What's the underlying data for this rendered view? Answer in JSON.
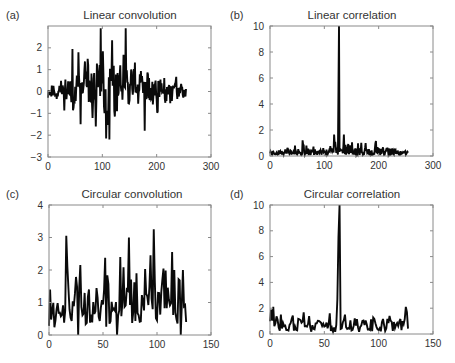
{
  "chart_data": [
    {
      "id": "a",
      "panel_label": "(a)",
      "type": "line",
      "title": "Linear convolution",
      "xlabel": "",
      "ylabel": "",
      "xlim": [
        0,
        300
      ],
      "ylim": [
        -3,
        3
      ],
      "xticks": [
        0,
        100,
        200,
        300
      ],
      "yticks": [
        -3,
        -2,
        -1,
        0,
        1,
        2
      ],
      "grid": false,
      "legend": null,
      "n_points": 255,
      "series": [
        {
          "name": "linear convolution",
          "color": "#0a0a0a"
        }
      ],
      "generator": {
        "seed": 11,
        "base": 0.05,
        "noise": 0.55,
        "smooth": 0.35,
        "envelope": "hump",
        "env_center": 127,
        "env_width": 110,
        "env_amp": 1.0,
        "min_amp": 0.35
      },
      "annotated_extremes": [
        {
          "x": 97,
          "y": 2.9
        },
        {
          "x": 143,
          "y": 2.9
        },
        {
          "x": 107,
          "y": -2.15
        },
        {
          "x": 113,
          "y": -2.2
        },
        {
          "x": 45,
          "y": 1.95
        },
        {
          "x": 56,
          "y": 1.8
        },
        {
          "x": 118,
          "y": 2.35
        },
        {
          "x": 178,
          "y": -1.8
        },
        {
          "x": 60,
          "y": -1.5
        },
        {
          "x": 88,
          "y": -1.6
        }
      ],
      "plot_box": {
        "x": 48,
        "y": 26,
        "w": 163,
        "h": 131
      }
    },
    {
      "id": "b",
      "panel_label": "(b)",
      "type": "line",
      "title": "Linear correlation",
      "xlabel": "",
      "ylabel": "",
      "xlim": [
        0,
        300
      ],
      "ylim": [
        0,
        10
      ],
      "xticks": [
        0,
        100,
        200,
        300
      ],
      "yticks": [
        0,
        2,
        4,
        6,
        8,
        10
      ],
      "grid": false,
      "legend": null,
      "n_points": 255,
      "series": [
        {
          "name": "linear correlation",
          "color": "#0a0a0a"
        }
      ],
      "generator": {
        "seed": 23,
        "base": 0.25,
        "noise": 0.45,
        "smooth": 0.2,
        "envelope": "hump",
        "env_center": 127,
        "env_width": 120,
        "env_amp": 0.55,
        "min_amp": 0.2,
        "abs": true
      },
      "annotated_extremes": [
        {
          "x": 127,
          "y": 10.0
        },
        {
          "x": 126,
          "y": 5.1
        },
        {
          "x": 118,
          "y": 1.65
        },
        {
          "x": 136,
          "y": 1.65
        },
        {
          "x": 60,
          "y": 1.2
        },
        {
          "x": 195,
          "y": 1.15
        }
      ],
      "plot_box": {
        "x": 270,
        "y": 26,
        "w": 163,
        "h": 130
      }
    },
    {
      "id": "c",
      "panel_label": "(c)",
      "type": "line",
      "title": "Circular convolution",
      "xlabel": "",
      "ylabel": "",
      "xlim": [
        0,
        150
      ],
      "ylim": [
        0,
        4
      ],
      "xticks": [
        0,
        50,
        100,
        150
      ],
      "yticks": [
        0,
        1,
        2,
        3,
        4
      ],
      "grid": false,
      "legend": null,
      "n_points": 128,
      "series": [
        {
          "name": "circular convolution",
          "color": "#0a0a0a"
        }
      ],
      "generator": {
        "seed": 37,
        "base": 0.85,
        "noise": 0.5,
        "smooth": 0.3,
        "envelope": "flat",
        "abs": true
      },
      "annotated_extremes": [
        {
          "x": 16,
          "y": 3.05
        },
        {
          "x": 27,
          "y": 2.3
        },
        {
          "x": 29,
          "y": 2.15
        },
        {
          "x": 66,
          "y": 2.4
        },
        {
          "x": 74,
          "y": 3.0
        },
        {
          "x": 81,
          "y": 1.9
        },
        {
          "x": 97,
          "y": 3.25
        },
        {
          "x": 114,
          "y": 2.55
        },
        {
          "x": 116,
          "y": 2.0
        },
        {
          "x": 124,
          "y": 2.0
        },
        {
          "x": 1,
          "y": 1.4
        },
        {
          "x": 27,
          "y": 0.0
        },
        {
          "x": 63,
          "y": 0.0
        },
        {
          "x": 122,
          "y": 0.0
        }
      ],
      "plot_box": {
        "x": 49,
        "y": 205,
        "w": 162,
        "h": 130
      }
    },
    {
      "id": "d",
      "panel_label": "(d)",
      "type": "line",
      "title": "Circular correlation",
      "xlabel": "",
      "ylabel": "",
      "xlim": [
        0,
        150
      ],
      "ylim": [
        0,
        10
      ],
      "xticks": [
        0,
        50,
        100,
        150
      ],
      "yticks": [
        0,
        2,
        4,
        6,
        8,
        10
      ],
      "grid": false,
      "legend": null,
      "n_points": 128,
      "series": [
        {
          "name": "circular correlation",
          "color": "#0a0a0a"
        }
      ],
      "generator": {
        "seed": 51,
        "base": 0.65,
        "noise": 0.3,
        "smooth": 0.25,
        "envelope": "flat",
        "abs": true
      },
      "annotated_extremes": [
        {
          "x": 64,
          "y": 10.0
        },
        {
          "x": 63,
          "y": 7.5
        },
        {
          "x": 62,
          "y": 2.7
        },
        {
          "x": 3,
          "y": 2.1
        },
        {
          "x": 1,
          "y": 1.9
        },
        {
          "x": 125,
          "y": 2.1
        },
        {
          "x": 55,
          "y": 1.6
        },
        {
          "x": 69,
          "y": 1.5
        },
        {
          "x": 10,
          "y": 1.5
        },
        {
          "x": 110,
          "y": 1.4
        }
      ],
      "plot_box": {
        "x": 270,
        "y": 205,
        "w": 163,
        "h": 129
      }
    }
  ]
}
